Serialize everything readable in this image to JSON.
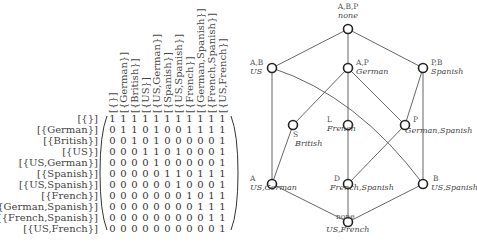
{
  "matrix": {
    "column_headers": [
      "[{}]",
      "[{German}]",
      "[{British}]",
      "[{US}]",
      "[{US,German}]",
      "[{Spanish}]",
      "[{US,Spanish}]",
      "[{French}]",
      "[{German,Spanish}]",
      "[{French,Spanish}]",
      "[{US,French}]"
    ],
    "row_labels": [
      "[{}]",
      "[{German}]",
      "[{British}]",
      "[{US}]",
      "[{US,German}]",
      "[{Spanish}]",
      "[{US,Spanish}]",
      "[{French}]",
      "[{German,Spanish}]",
      "[{French,Spanish}]",
      "[{US,French}]"
    ],
    "rows": [
      [
        1,
        1,
        1,
        1,
        1,
        1,
        1,
        1,
        1,
        1,
        1
      ],
      [
        0,
        1,
        1,
        0,
        1,
        0,
        0,
        1,
        1,
        1,
        1
      ],
      [
        0,
        0,
        1,
        0,
        1,
        0,
        0,
        0,
        0,
        0,
        1
      ],
      [
        0,
        0,
        0,
        1,
        1,
        0,
        1,
        0,
        0,
        0,
        1
      ],
      [
        0,
        0,
        0,
        0,
        1,
        0,
        0,
        0,
        0,
        0,
        1
      ],
      [
        0,
        0,
        0,
        0,
        0,
        1,
        1,
        0,
        1,
        1,
        1
      ],
      [
        0,
        0,
        0,
        0,
        0,
        0,
        1,
        0,
        0,
        0,
        1
      ],
      [
        0,
        0,
        0,
        0,
        0,
        0,
        0,
        1,
        0,
        1,
        1
      ],
      [
        0,
        0,
        0,
        0,
        0,
        0,
        0,
        0,
        1,
        1,
        1
      ],
      [
        0,
        0,
        0,
        0,
        0,
        0,
        0,
        0,
        0,
        1,
        1
      ],
      [
        0,
        0,
        0,
        0,
        0,
        0,
        0,
        0,
        0,
        0,
        1
      ]
    ]
  },
  "lattice": {
    "nodes": [
      {
        "id": "top",
        "label": "A,B,P",
        "name": "none"
      },
      {
        "id": "us",
        "label": "A,B",
        "name": "US"
      },
      {
        "id": "german",
        "label": "A,P",
        "name": "German"
      },
      {
        "id": "spanish",
        "label": "P,B",
        "name": "Spanish"
      },
      {
        "id": "british",
        "label": "S",
        "name": "British"
      },
      {
        "id": "french",
        "label": "L",
        "name": "French"
      },
      {
        "id": "german-spanish",
        "label": "P",
        "name": "German,Spanish"
      },
      {
        "id": "us-german",
        "label": "A",
        "name": "US,German"
      },
      {
        "id": "french-spanish",
        "label": "D",
        "name": "French,Spanish"
      },
      {
        "id": "us-spanish",
        "label": "B",
        "name": "US,Spanish"
      },
      {
        "id": "bottom",
        "label": "none",
        "name": "US,French"
      }
    ],
    "edges": [
      [
        "top",
        "us"
      ],
      [
        "top",
        "german"
      ],
      [
        "top",
        "spanish"
      ],
      [
        "us",
        "us-german"
      ],
      [
        "us",
        "us-spanish"
      ],
      [
        "german",
        "british"
      ],
      [
        "german",
        "french"
      ],
      [
        "german",
        "german-spanish"
      ],
      [
        "spanish",
        "german-spanish"
      ],
      [
        "spanish",
        "us-spanish"
      ],
      [
        "british",
        "us-german"
      ],
      [
        "french",
        "french-spanish"
      ],
      [
        "german-spanish",
        "french-spanish"
      ],
      [
        "us-german",
        "bottom"
      ],
      [
        "french-spanish",
        "bottom"
      ],
      [
        "us-spanish",
        "bottom"
      ]
    ]
  }
}
